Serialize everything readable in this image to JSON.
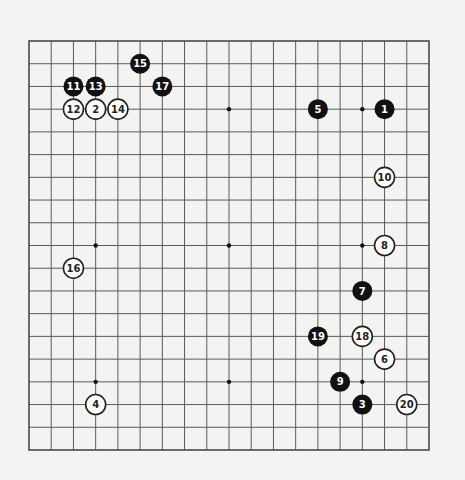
{
  "diagram": {
    "type": "go-game-record",
    "board_size": 19,
    "colors": {
      "background": "#f3f3f1",
      "grid": "#5a5a5a",
      "black_stone": "#111111",
      "white_stone": "#ffffff"
    },
    "star_points": [
      [
        3,
        3
      ],
      [
        9,
        3
      ],
      [
        15,
        3
      ],
      [
        3,
        9
      ],
      [
        9,
        9
      ],
      [
        15,
        9
      ],
      [
        3,
        15
      ],
      [
        9,
        15
      ],
      [
        15,
        15
      ]
    ],
    "moves": [
      {
        "n": "1",
        "color": "black",
        "col": 16,
        "row": 3
      },
      {
        "n": "2",
        "color": "white",
        "col": 3,
        "row": 3
      },
      {
        "n": "3",
        "color": "black",
        "col": 15,
        "row": 16
      },
      {
        "n": "4",
        "color": "white",
        "col": 3,
        "row": 16
      },
      {
        "n": "5",
        "color": "black",
        "col": 13,
        "row": 3
      },
      {
        "n": "6",
        "color": "white",
        "col": 16,
        "row": 14
      },
      {
        "n": "7",
        "color": "black",
        "col": 15,
        "row": 11
      },
      {
        "n": "8",
        "color": "white",
        "col": 16,
        "row": 9
      },
      {
        "n": "9",
        "color": "black",
        "col": 14,
        "row": 15
      },
      {
        "n": "10",
        "color": "white",
        "col": 16,
        "row": 6
      },
      {
        "n": "11",
        "color": "black",
        "col": 2,
        "row": 2
      },
      {
        "n": "12",
        "color": "white",
        "col": 2,
        "row": 3
      },
      {
        "n": "13",
        "color": "black",
        "col": 3,
        "row": 2
      },
      {
        "n": "14",
        "color": "white",
        "col": 4,
        "row": 3
      },
      {
        "n": "15",
        "color": "black",
        "col": 5,
        "row": 1
      },
      {
        "n": "16",
        "color": "white",
        "col": 2,
        "row": 10
      },
      {
        "n": "17",
        "color": "black",
        "col": 6,
        "row": 2
      },
      {
        "n": "18",
        "color": "white",
        "col": 15,
        "row": 13
      },
      {
        "n": "19",
        "color": "black",
        "col": 13,
        "row": 13
      },
      {
        "n": "20",
        "color": "white",
        "col": 17,
        "row": 16
      }
    ]
  }
}
